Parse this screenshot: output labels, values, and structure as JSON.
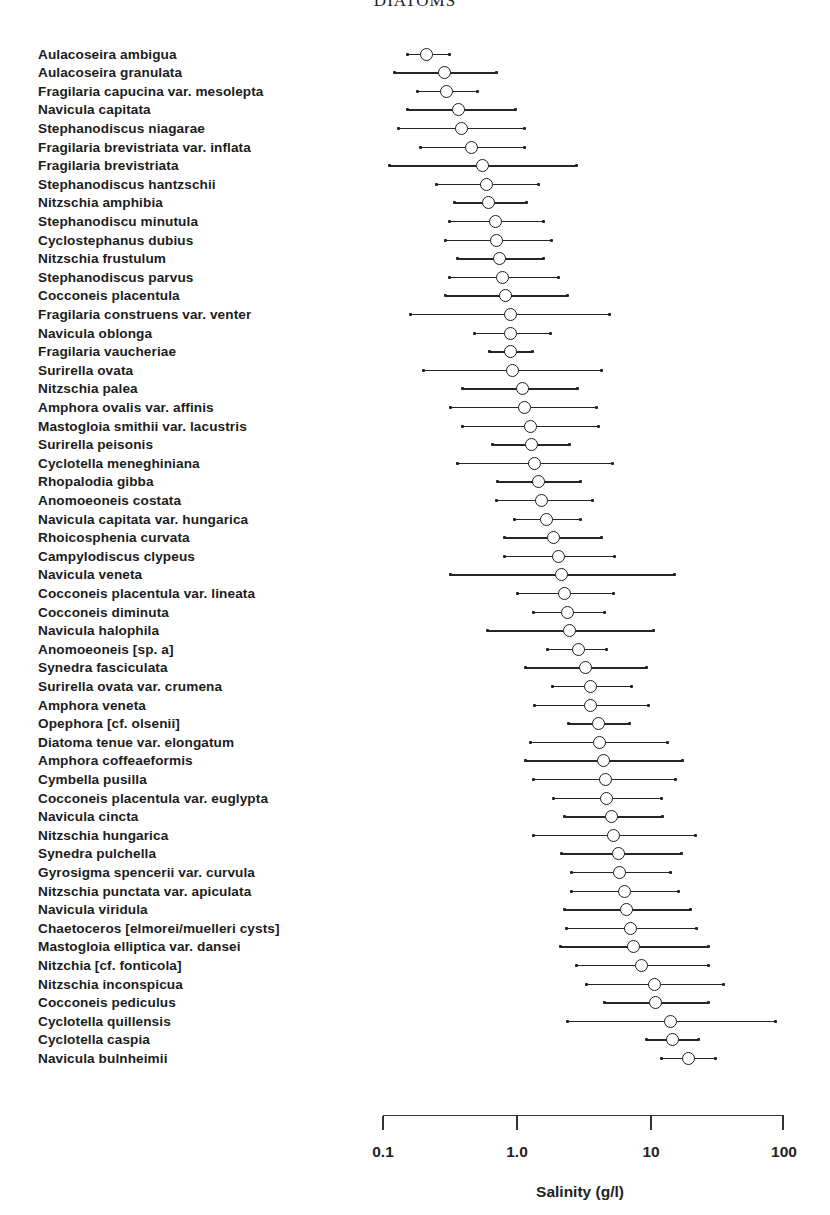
{
  "chart_data": {
    "type": "scatter",
    "subtype": "dot-and-range (optimum with tolerance range)",
    "title": "DIATOMS",
    "xlabel": "Salinity (g/l)",
    "ylabel": "",
    "xscale": "log",
    "xlim": [
      0.1,
      100
    ],
    "xticks": [
      "0.1",
      "1.0",
      "10",
      "100"
    ],
    "grid": false,
    "legend": null,
    "series": [
      {
        "name": "Aulacoseira ambigua",
        "low": 0.15,
        "optimum": 0.21,
        "high": 0.31
      },
      {
        "name": "Aulacoseira granulata",
        "low": 0.12,
        "optimum": 0.29,
        "high": 0.7
      },
      {
        "name": "Fragilaria capucina var. mesolepta",
        "low": 0.18,
        "optimum": 0.3,
        "high": 0.51
      },
      {
        "name": "Navicula capitata",
        "low": 0.15,
        "optimum": 0.37,
        "high": 0.97
      },
      {
        "name": "Stephanodiscus niagarae",
        "low": 0.13,
        "optimum": 0.39,
        "high": 1.13
      },
      {
        "name": "Fragilaria brevistriata var. inflata",
        "low": 0.19,
        "optimum": 0.46,
        "high": 1.13
      },
      {
        "name": "Fragilaria brevistriata",
        "low": 0.11,
        "optimum": 0.56,
        "high": 2.77
      },
      {
        "name": "Stephanodiscus hantzschii",
        "low": 0.25,
        "optimum": 0.6,
        "high": 1.46
      },
      {
        "name": "Nitzschia amphibia",
        "low": 0.34,
        "optimum": 0.62,
        "high": 1.17
      },
      {
        "name": "Stephanodiscu minutula",
        "low": 0.31,
        "optimum": 0.7,
        "high": 1.57
      },
      {
        "name": "Cyclostephanus dubius",
        "low": 0.29,
        "optimum": 0.71,
        "high": 1.8
      },
      {
        "name": "Nitzschia frustulum",
        "low": 0.36,
        "optimum": 0.75,
        "high": 1.59
      },
      {
        "name": "Stephanodiscus parvus",
        "low": 0.31,
        "optimum": 0.79,
        "high": 2.06
      },
      {
        "name": "Cocconeis placentula",
        "low": 0.29,
        "optimum": 0.83,
        "high": 2.37
      },
      {
        "name": "Fragilaria construens var. venter",
        "low": 0.16,
        "optimum": 0.9,
        "high": 4.97
      },
      {
        "name": "Navicula oblonga",
        "low": 0.48,
        "optimum": 0.9,
        "high": 1.77
      },
      {
        "name": "Fragilaria vaucheriae",
        "low": 0.62,
        "optimum": 0.9,
        "high": 1.3
      },
      {
        "name": "Surirella ovata",
        "low": 0.2,
        "optimum": 0.93,
        "high": 4.26
      },
      {
        "name": "Nitzschia palea",
        "low": 0.39,
        "optimum": 1.11,
        "high": 2.86
      },
      {
        "name": "Amphora ovalis var. affinis",
        "low": 0.32,
        "optimum": 1.15,
        "high": 3.97
      },
      {
        "name": "Mastogloia smithii var. lacustris",
        "low": 0.39,
        "optimum": 1.27,
        "high": 4.11
      },
      {
        "name": "Surirella peisonis",
        "low": 0.66,
        "optimum": 1.3,
        "high": 2.49
      },
      {
        "name": "Cyclotella meneghiniana",
        "low": 0.36,
        "optimum": 1.36,
        "high": 5.15
      },
      {
        "name": "Rhopalodia gibba",
        "low": 0.72,
        "optimum": 1.46,
        "high": 3.01
      },
      {
        "name": "Anomoeoneis costata",
        "low": 0.7,
        "optimum": 1.54,
        "high": 3.65
      },
      {
        "name": "Navicula capitata var. hungarica",
        "low": 0.95,
        "optimum": 1.68,
        "high": 3.01
      },
      {
        "name": "Rhoicosphenia curvata",
        "low": 0.8,
        "optimum": 1.89,
        "high": 4.33
      },
      {
        "name": "Campylodiscus clypeus",
        "low": 0.8,
        "optimum": 2.06,
        "high": 5.42
      },
      {
        "name": "Navicula veneta",
        "low": 0.32,
        "optimum": 2.17,
        "high": 15.0
      },
      {
        "name": "Cocconeis placentula var. lineata",
        "low": 1.0,
        "optimum": 2.29,
        "high": 5.24
      },
      {
        "name": "Cocconeis diminuta",
        "low": 1.34,
        "optimum": 2.41,
        "high": 4.56
      },
      {
        "name": "Navicula halophila",
        "low": 0.6,
        "optimum": 2.49,
        "high": 10.6
      },
      {
        "name": "Anomoeoneis [sp. a]",
        "low": 1.68,
        "optimum": 2.91,
        "high": 4.72
      },
      {
        "name": "Synedra fasciculata",
        "low": 1.15,
        "optimum": 3.29,
        "high": 9.28
      },
      {
        "name": "Surirella ovata var. crumena",
        "low": 1.83,
        "optimum": 3.58,
        "high": 7.16
      },
      {
        "name": "Amphora veneta",
        "low": 1.36,
        "optimum": 3.58,
        "high": 9.73
      },
      {
        "name": "Opephora [cf. olsenii]",
        "low": 2.45,
        "optimum": 4.11,
        "high": 7.02
      },
      {
        "name": "Diatoma tenue var. elongatum",
        "low": 1.27,
        "optimum": 4.18,
        "high": 13.3
      },
      {
        "name": "Amphora coffeaeformis",
        "low": 1.15,
        "optimum": 4.49,
        "high": 17.5
      },
      {
        "name": "Cymbella pusilla",
        "low": 1.34,
        "optimum": 4.64,
        "high": 15.5
      },
      {
        "name": "Cocconeis placentula var. euglypta",
        "low": 1.89,
        "optimum": 4.72,
        "high": 12.0
      },
      {
        "name": "Navicula cincta",
        "low": 2.25,
        "optimum": 5.15,
        "high": 12.2
      },
      {
        "name": "Nitzschia hungarica",
        "low": 1.32,
        "optimum": 5.33,
        "high": 21.6
      },
      {
        "name": "Synedra pulchella",
        "low": 2.14,
        "optimum": 5.81,
        "high": 17.2
      },
      {
        "name": "Gyrosigma spencerii var. curvula",
        "low": 2.54,
        "optimum": 5.91,
        "high": 14.2
      },
      {
        "name": "Nitzschia punctata var. apiculata",
        "low": 2.58,
        "optimum": 6.44,
        "high": 16.3
      },
      {
        "name": "Navicula viridula",
        "low": 2.25,
        "optimum": 6.67,
        "high": 19.8
      },
      {
        "name": "Chaetoceros [elmorei/muelleri cysts]",
        "low": 2.33,
        "optimum": 7.16,
        "high": 22.3
      },
      {
        "name": "Mastogloia elliptica var. dansei",
        "low": 2.1,
        "optimum": 7.54,
        "high": 27.0
      },
      {
        "name": "Nitzchia [cf. fonticola]",
        "low": 2.81,
        "optimum": 8.64,
        "high": 27.4
      },
      {
        "name": "Nitzschia inconspicua",
        "low": 3.34,
        "optimum": 10.8,
        "high": 35.5
      },
      {
        "name": "Cocconeis pediculus",
        "low": 4.56,
        "optimum": 11.0,
        "high": 27.4
      },
      {
        "name": "Cyclotella quillensis",
        "low": 2.37,
        "optimum": 14.3,
        "high": 87.0
      },
      {
        "name": "Cyclotella caspia",
        "low": 9.28,
        "optimum": 14.7,
        "high": 23.0
      },
      {
        "name": "Navicula bulnheimii",
        "low": 12.0,
        "optimum": 19.4,
        "high": 30.9
      }
    ]
  },
  "axis": {
    "ticks": [
      {
        "label": "0.1",
        "value": 0.1
      },
      {
        "label": "1.0",
        "value": 1
      },
      {
        "label": "10",
        "value": 10
      },
      {
        "label": "100",
        "value": 100
      }
    ],
    "label": "Salinity (g/l)"
  },
  "title": "DIATOMS"
}
